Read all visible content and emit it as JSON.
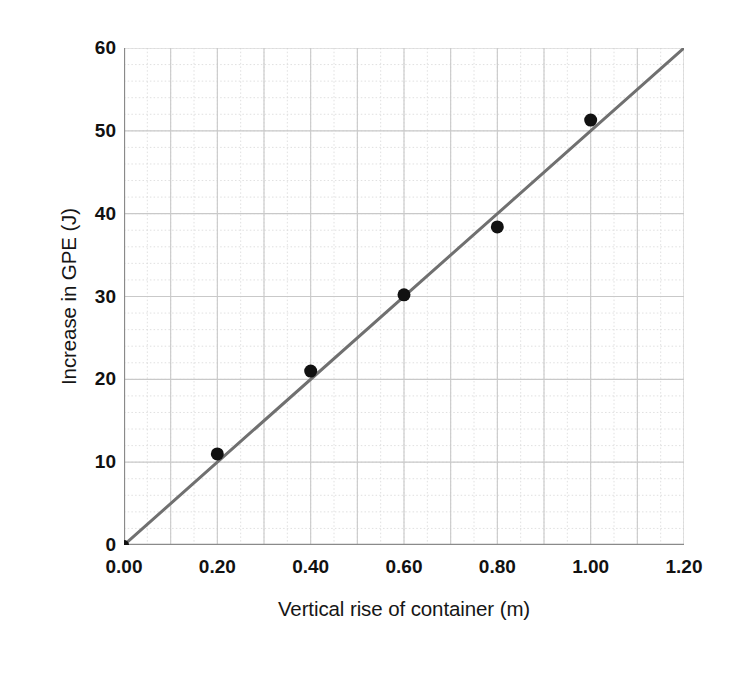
{
  "chart_data": {
    "type": "scatter",
    "title": "",
    "xlabel": "Vertical rise of container (m)",
    "ylabel": "Increase in GPE (J)",
    "xlim": [
      0.0,
      1.2
    ],
    "ylim": [
      0,
      60
    ],
    "xticks": [
      "0.00",
      "0.20",
      "0.40",
      "0.60",
      "0.80",
      "1.00",
      "1.20"
    ],
    "xtick_values": [
      0.0,
      0.2,
      0.4,
      0.6,
      0.8,
      1.0,
      1.2
    ],
    "yticks": [
      "0",
      "10",
      "20",
      "30",
      "40",
      "50",
      "60"
    ],
    "ytick_values": [
      0,
      10,
      20,
      30,
      40,
      50,
      60
    ],
    "grid": true,
    "grid_major_x_step": 0.1,
    "grid_major_y_step": 10,
    "grid_minor_x_step": 0.05,
    "grid_minor_y_step": 2,
    "legend": null,
    "x": [
      0.0,
      0.2,
      0.4,
      0.6,
      0.8,
      1.0
    ],
    "y": [
      0.0,
      11.0,
      21.0,
      30.2,
      38.4,
      51.3
    ],
    "points": [
      {
        "x": 0.0,
        "y": 0.0
      },
      {
        "x": 0.2,
        "y": 11.0
      },
      {
        "x": 0.4,
        "y": 21.0
      },
      {
        "x": 0.6,
        "y": 30.2
      },
      {
        "x": 0.8,
        "y": 38.4
      },
      {
        "x": 1.0,
        "y": 51.3
      }
    ],
    "trendline": {
      "label": "line of best fit",
      "x0": 0.0,
      "y0": 0.0,
      "x1": 1.2,
      "y1": 60.0,
      "slope": 50.0,
      "intercept": 0.0
    },
    "colors": {
      "marker": "#111111",
      "trendline": "#707070",
      "grid_major": "#c9c9c9",
      "grid_minor": "#d8d8d8",
      "axis": "#8a8a8a",
      "background": "#ffffff",
      "text": "#161616"
    },
    "marker_radius_px": 6.5,
    "trendline_width_px": 3.0
  }
}
